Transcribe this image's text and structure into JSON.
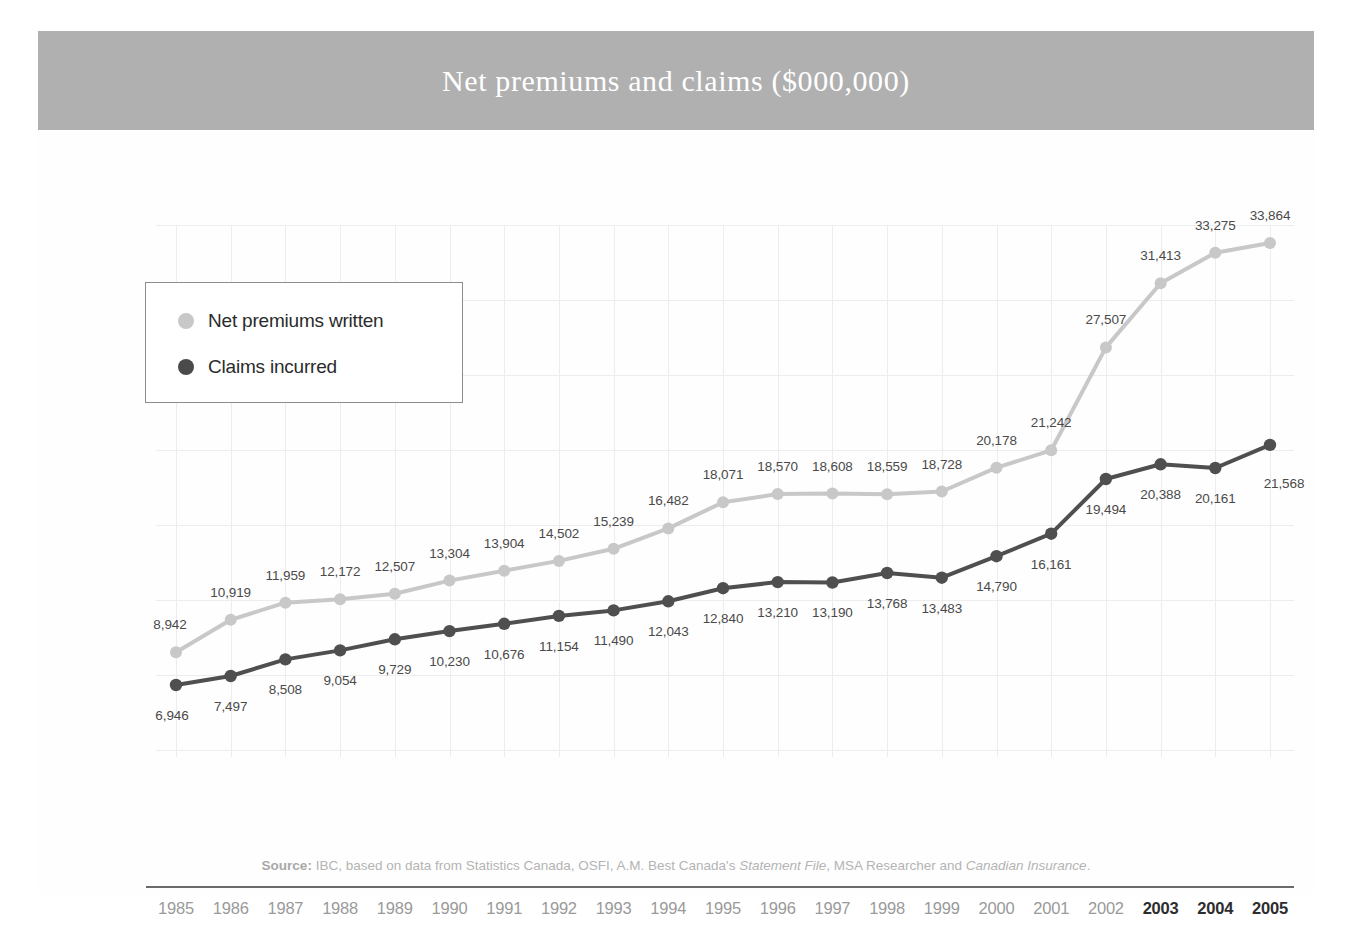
{
  "title": "Net premiums and claims ($000,000)",
  "legend": {
    "items": [
      {
        "label": "Net premiums written",
        "color": "#c8c8c8",
        "dot": "legend-dot-premiums"
      },
      {
        "label": "Claims incurred",
        "color": "#4a4a4a",
        "dot": "legend-dot-claims"
      }
    ]
  },
  "source": {
    "prefix": "Source:",
    "part1": " IBC, based on data from Statistics Canada, OSFI, A.M. Best Canada's ",
    "italic1": "Statement File",
    "part2": ", MSA Researcher and ",
    "italic2": "Canadian Insurance",
    "suffix": "."
  },
  "axis": {
    "bold_years": [
      "2003",
      "2004",
      "2005"
    ]
  },
  "chart_data": {
    "type": "line",
    "title": "Net premiums and claims ($000,000)",
    "xlabel": "",
    "ylabel": "",
    "grid": true,
    "legend_position": "inside-top-left",
    "categories": [
      "1985",
      "1986",
      "1987",
      "1988",
      "1989",
      "1990",
      "1991",
      "1992",
      "1993",
      "1994",
      "1995",
      "1996",
      "1997",
      "1998",
      "1999",
      "2000",
      "2001",
      "2002",
      "2003",
      "2004",
      "2005"
    ],
    "series": [
      {
        "name": "Net premiums written",
        "color": "#c8c8c8",
        "values": [
          8942,
          10919,
          11959,
          12172,
          12507,
          13304,
          13904,
          14502,
          15239,
          16482,
          18071,
          18570,
          18608,
          18559,
          18728,
          20178,
          21242,
          27507,
          31413,
          33275,
          33864
        ],
        "labels": [
          "8,942",
          "10,919",
          "11,959",
          "12,172",
          "12,507",
          "13,304",
          "13,904",
          "14,502",
          "15,239",
          "16,482",
          "18,071",
          "18,570",
          "18,608",
          "18,559",
          "18,728",
          "20,178",
          "21,242",
          "27,507",
          "31,413",
          "33,275",
          "33,864"
        ]
      },
      {
        "name": "Claims incurred",
        "color": "#4f4f4f",
        "values": [
          6946,
          7497,
          8508,
          9054,
          9729,
          10230,
          10676,
          11154,
          11490,
          12043,
          12840,
          13210,
          13190,
          13768,
          13483,
          14790,
          16161,
          19494,
          20388,
          20161,
          21568
        ],
        "labels": [
          "6,946",
          "7,497",
          "8,508",
          "9,054",
          "9,729",
          "10,230",
          "10,676",
          "11,154",
          "11,490",
          "12,043",
          "12,840",
          "13,210",
          "13,190",
          "13,768",
          "13,483",
          "14,790",
          "16,161",
          "19,494",
          "20,388",
          "20,161",
          "21,568"
        ]
      }
    ]
  }
}
